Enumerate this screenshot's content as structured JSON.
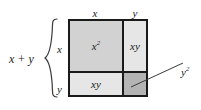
{
  "figure": {
    "name": "area-model-square-of-binomial",
    "background_color": "#ffffff",
    "ink_color": "#1a1a1a"
  },
  "labels": {
    "sum_left": "x + y",
    "top_x": "x",
    "top_y": "y",
    "side_x": "x",
    "side_y": "y"
  },
  "cells": [
    {
      "id": "x-squared",
      "base": "x",
      "exponent": "2",
      "fill": "#d2d2d2",
      "position": "top-left"
    },
    {
      "id": "xy-top-right",
      "base": "xy",
      "exponent": "",
      "fill": "#e6e6e6",
      "position": "top-right"
    },
    {
      "id": "xy-bottom-left",
      "base": "xy",
      "exponent": "",
      "fill": "#e6e6e6",
      "position": "bottom-left"
    },
    {
      "id": "y-squared",
      "base": "",
      "exponent": "",
      "fill": "#b4b4b4",
      "position": "bottom-right"
    }
  ],
  "callout": {
    "base": "y",
    "exponent": "2",
    "target_cell": "y-squared"
  }
}
